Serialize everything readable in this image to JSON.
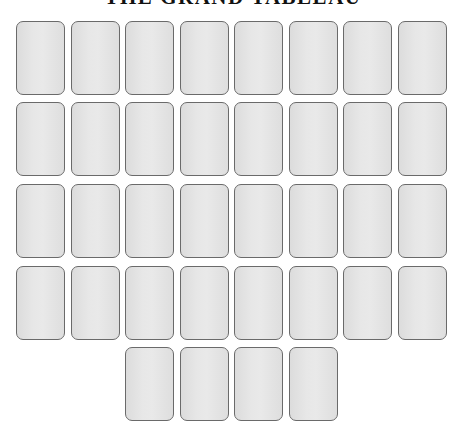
{
  "title": "THE GRAND TABLEAU",
  "colors": {
    "card_fill": "#e4e4e4",
    "card_border": "#6a6a6a",
    "title": "#111111",
    "background": "#ffffff"
  },
  "layout": {
    "column_x": [
      16,
      70.5,
      125,
      179.5,
      234,
      288.5,
      343,
      397.5
    ],
    "row_y": [
      21,
      102,
      184,
      266,
      347
    ]
  },
  "tableau": {
    "rows": [
      {
        "row": 1,
        "cards": [
          {
            "col": 1,
            "face": "down"
          },
          {
            "col": 2,
            "face": "down"
          },
          {
            "col": 3,
            "face": "down"
          },
          {
            "col": 4,
            "face": "down"
          },
          {
            "col": 5,
            "face": "down"
          },
          {
            "col": 6,
            "face": "down"
          },
          {
            "col": 7,
            "face": "down"
          },
          {
            "col": 8,
            "face": "down"
          }
        ]
      },
      {
        "row": 2,
        "cards": [
          {
            "col": 1,
            "face": "down"
          },
          {
            "col": 2,
            "face": "down"
          },
          {
            "col": 3,
            "face": "down"
          },
          {
            "col": 4,
            "face": "down"
          },
          {
            "col": 5,
            "face": "down"
          },
          {
            "col": 6,
            "face": "down"
          },
          {
            "col": 7,
            "face": "down"
          },
          {
            "col": 8,
            "face": "down"
          }
        ]
      },
      {
        "row": 3,
        "cards": [
          {
            "col": 1,
            "face": "down"
          },
          {
            "col": 2,
            "face": "down"
          },
          {
            "col": 3,
            "face": "down"
          },
          {
            "col": 4,
            "face": "down"
          },
          {
            "col": 5,
            "face": "down"
          },
          {
            "col": 6,
            "face": "down"
          },
          {
            "col": 7,
            "face": "down"
          },
          {
            "col": 8,
            "face": "down"
          }
        ]
      },
      {
        "row": 4,
        "cards": [
          {
            "col": 1,
            "face": "down"
          },
          {
            "col": 2,
            "face": "down"
          },
          {
            "col": 3,
            "face": "down"
          },
          {
            "col": 4,
            "face": "down"
          },
          {
            "col": 5,
            "face": "down"
          },
          {
            "col": 6,
            "face": "down"
          },
          {
            "col": 7,
            "face": "down"
          },
          {
            "col": 8,
            "face": "down"
          }
        ]
      },
      {
        "row": 5,
        "cards": [
          {
            "col": 3,
            "face": "down"
          },
          {
            "col": 4,
            "face": "down"
          },
          {
            "col": 5,
            "face": "down"
          },
          {
            "col": 6,
            "face": "down"
          }
        ]
      }
    ],
    "total_cards": 36
  }
}
